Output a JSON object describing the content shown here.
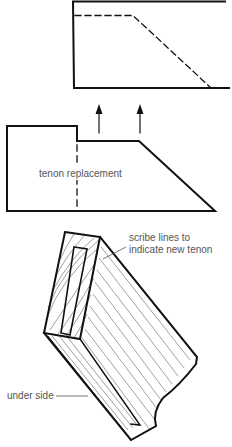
{
  "diagram": {
    "figures": [
      {
        "id": "top-view",
        "description": "Rail end with dashed outline of original profile"
      },
      {
        "id": "side-view",
        "description": "Rail end with step and dashed tenon replacement line, two upward arrows",
        "label": "tenon replacement"
      },
      {
        "id": "perspective-view",
        "description": "Perspective view of rail end showing grain and scribed tenon slot",
        "labels": {
          "scribe_line1": "scribe lines to",
          "scribe_line2": "indicate new tenon",
          "under_side": "under side"
        }
      }
    ],
    "colors": {
      "ink": "#111111",
      "label": "#555555",
      "grain": "#777777",
      "background": "#ffffff"
    }
  }
}
